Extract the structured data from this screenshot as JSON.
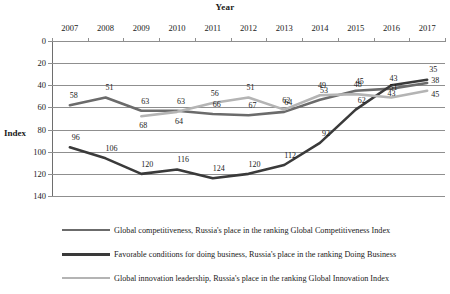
{
  "chart_data": {
    "type": "line",
    "title": "",
    "xlabel": "Year",
    "ylabel": "Index",
    "categories": [
      "2007",
      "2008",
      "2009",
      "2010",
      "2011",
      "2012",
      "2013",
      "2014",
      "2015",
      "2016",
      "2017"
    ],
    "ylim": [
      0,
      140
    ],
    "y_inverted": true,
    "y_ticks": [
      0,
      20,
      40,
      60,
      80,
      100,
      120,
      140
    ],
    "grid": true,
    "legend_position": "bottom",
    "series": [
      {
        "name": "Global competitiveness, Russia's place in the ranking Global Competitiveness Index",
        "color": "#6b6b6b",
        "values": [
          58,
          51,
          63,
          63,
          66,
          67,
          64,
          53,
          45,
          43,
          38
        ],
        "labels": [
          "58",
          "51",
          "63",
          "63",
          "66",
          "67",
          "64",
          "53",
          "45",
          "43",
          "38"
        ]
      },
      {
        "name": "Favorable conditions for doing business, Russia's place in the ranking Doing Business",
        "color": "#3a3a3a",
        "values": [
          96,
          106,
          120,
          116,
          124,
          120,
          112,
          92,
          62,
          40,
          35
        ],
        "labels": [
          "96",
          "106",
          "120",
          "116",
          "124",
          "120",
          "112",
          "92",
          "62",
          "43",
          "35"
        ]
      },
      {
        "name": "Global innovation leadership, Russia's place in the ranking Global Innovation Index",
        "color": "#b4b4b4",
        "values": [
          null,
          null,
          68,
          64,
          56,
          51,
          62,
          49,
          48,
          51,
          45
        ],
        "labels": [
          "",
          "",
          "68",
          "64",
          "56",
          "51",
          "62",
          "49",
          "48",
          "51",
          "45"
        ]
      }
    ]
  },
  "axis": {
    "x_title": "Year",
    "y_title": "Index"
  }
}
